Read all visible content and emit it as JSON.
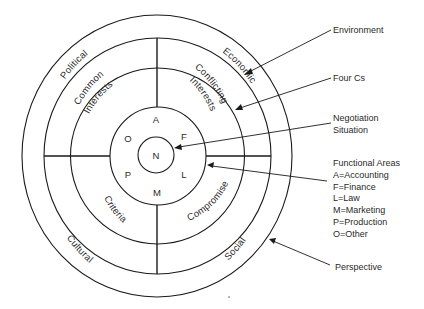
{
  "diagram": {
    "center_label": "N",
    "functional_letters": {
      "top": "A",
      "upper_right": "F",
      "lower_right": "L",
      "bottom": "M",
      "lower_left": "P",
      "upper_left": "O"
    },
    "four_cs": {
      "upper_left": "Common Interests",
      "upper_left_lines": [
        "Common",
        "Interests"
      ],
      "upper_right": "Conflicting Interests",
      "upper_right_lines": [
        "Conflicting",
        "Interests"
      ],
      "lower_left": "Criteria",
      "lower_right": "Compromise"
    },
    "environment": {
      "upper_left": "Political",
      "upper_right": "Economic",
      "lower_left": "Cultural",
      "lower_right": "Social"
    },
    "callouts": {
      "environment": "Environment",
      "four_cs": "Four Cs",
      "negotiation_lines": [
        "Negotiation",
        "Situation"
      ],
      "functional_areas": {
        "title": "Functional Areas",
        "items": [
          "A=Accounting",
          "F=Finance",
          "L=Law",
          "M=Marketing",
          "P=Production",
          "O=Other"
        ]
      },
      "perspective": "Perspective"
    }
  }
}
